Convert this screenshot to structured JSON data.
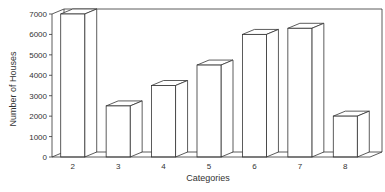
{
  "chart_data": {
    "type": "bar",
    "style": "3d",
    "title": "",
    "xlabel": "Categories",
    "ylabel": "Number of Houses",
    "categories": [
      "2",
      "3",
      "4",
      "5",
      "6",
      "7",
      "8"
    ],
    "values": [
      7000,
      2500,
      3500,
      4500,
      6000,
      6300,
      2000
    ],
    "ylim": [
      0,
      7000
    ],
    "yticks": [
      0,
      1000,
      2000,
      3000,
      4000,
      5000,
      6000,
      7000
    ],
    "grid": false,
    "legend": null,
    "colors": {
      "bar_fill": "#ffffff",
      "stroke": "#333333"
    }
  }
}
